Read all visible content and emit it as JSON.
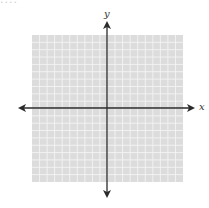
{
  "header": {
    "cutoff_text": "...."
  },
  "diagram": {
    "type": "coordinate-plane",
    "x_axis_label": "x",
    "y_axis_label": "y",
    "grid": {
      "columns": 20,
      "rows": 20,
      "background_color": "#dcdcdc",
      "line_color": "#f4f4f4"
    },
    "axis_color": "#2a2a2a",
    "arrows": [
      "left",
      "right",
      "up",
      "down"
    ]
  }
}
